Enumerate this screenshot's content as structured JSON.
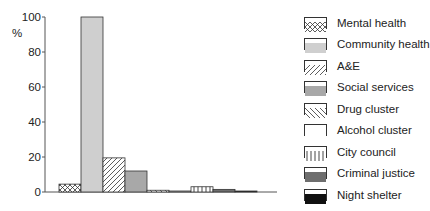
{
  "chart_data": {
    "type": "bar",
    "title": "",
    "xlabel": "",
    "ylabel": "%",
    "ylim": [
      0,
      100
    ],
    "yticks": [
      0,
      20,
      40,
      60,
      80,
      100
    ],
    "grid": false,
    "legend_position": "right",
    "categories": [
      "Mental health",
      "Community health",
      "A&E",
      "Social services",
      "Drug cluster",
      "Alcohol cluster",
      "City council",
      "Criminal justice",
      "Night shelter"
    ],
    "values": [
      4.5,
      100,
      19.5,
      12,
      1,
      0.5,
      3,
      1.5,
      0.5
    ],
    "patterns": [
      "crosshatch",
      "light-grey",
      "diagonal-right",
      "mid-grey",
      "diagonal-left",
      "white",
      "vertical-lines",
      "dark-grey",
      "black"
    ]
  },
  "legend": {
    "items": [
      {
        "label": "Mental health",
        "pattern": "crosshatch"
      },
      {
        "label": "Community health",
        "pattern": "light-grey"
      },
      {
        "label": "A&E",
        "pattern": "diagonal-right"
      },
      {
        "label": "Social services",
        "pattern": "mid-grey"
      },
      {
        "label": "Drug cluster",
        "pattern": "diagonal-left"
      },
      {
        "label": "Alcohol cluster",
        "pattern": "white"
      },
      {
        "label": "City council",
        "pattern": "vertical-lines"
      },
      {
        "label": "Criminal justice",
        "pattern": "dark-grey"
      },
      {
        "label": "Night shelter",
        "pattern": "black"
      }
    ]
  },
  "colors": {
    "light-grey": "#cfcfcf",
    "mid-grey": "#a8a8a8",
    "dark-grey": "#6e6e6e",
    "black": "#111111",
    "white": "#ffffff",
    "axis": "#555555"
  }
}
